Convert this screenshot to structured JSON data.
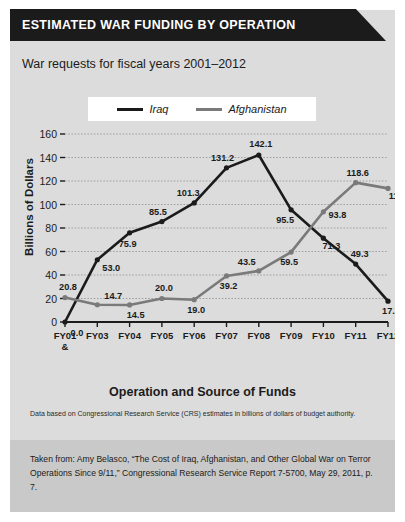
{
  "header": {
    "title": "ESTIMATED WAR FUNDING BY OPERATION"
  },
  "subtitle": "War requests for fiscal years 2001–2012",
  "note": "Data based on Congressional Research Service (CRS) estimates in billions of dollars of budget authority.",
  "citation": "Taken from: Amy Belasco, “The Cost of Iraq, Afghanistan, and Other Global War on Terror Operations Since 9/11,” Congressional Research Service Report 7-5700, May 29, 2011, p. 7.",
  "colors": {
    "iraq": "#1b1b1b",
    "afghanistan": "#7a7a7a",
    "panel": "#dcdcdc",
    "banner": "#1b1b1b",
    "citation_bg": "#c9c9c9",
    "gridline": "#9a9a9a",
    "axis": "#1b1b1b"
  },
  "chart_data": {
    "type": "line",
    "title": "ESTIMATED WAR FUNDING BY OPERATION",
    "subtitle": "War requests for fiscal years 2001–2012",
    "xlabel": "Operation and Source of Funds",
    "ylabel": "Billions of Dollars",
    "ylim": [
      0,
      160
    ],
    "yticks": [
      0,
      20,
      40,
      60,
      80,
      100,
      120,
      140,
      160
    ],
    "grid": true,
    "legend_position": "top-center",
    "categories": [
      "FY01 & FY02",
      "FY03",
      "FY04",
      "FY05",
      "FY06",
      "FY07",
      "FY08",
      "FY09",
      "FY10",
      "FY11",
      "FY12"
    ],
    "category_lines": [
      [
        "FY01",
        "&",
        "FY02"
      ],
      [
        "FY03"
      ],
      [
        "FY04"
      ],
      [
        "FY05"
      ],
      [
        "FY06"
      ],
      [
        "FY07"
      ],
      [
        "FY08"
      ],
      [
        "FY09"
      ],
      [
        "FY10"
      ],
      [
        "FY11"
      ],
      [
        "FY12"
      ]
    ],
    "series": [
      {
        "name": "Iraq",
        "color": "#1b1b1b",
        "values": [
          0.0,
          53.0,
          75.9,
          85.5,
          101.3,
          131.2,
          142.1,
          95.5,
          71.3,
          49.3,
          17.7
        ],
        "labels": [
          "0.0",
          "53.0",
          "75.9",
          "85.5",
          "101.3",
          "131.2",
          "142.1",
          "95.5",
          "71.3",
          "49.3",
          "17.7"
        ]
      },
      {
        "name": "Afghanistan",
        "color": "#7a7a7a",
        "values": [
          20.8,
          14.7,
          14.5,
          20.0,
          19.0,
          39.2,
          43.5,
          59.5,
          93.8,
          118.6,
          113.7
        ],
        "labels": [
          "20.8",
          "14.7",
          "14.5",
          "20.0",
          "19.0",
          "39.2",
          "43.5",
          "59.5",
          "93.8",
          "118.6",
          "113.7"
        ]
      }
    ]
  }
}
